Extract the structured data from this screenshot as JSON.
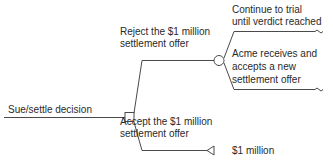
{
  "diagram": {
    "type": "decision-tree",
    "root": {
      "label": "Sue/settle decision",
      "node_type": "decision"
    },
    "branches": {
      "reject": {
        "label_line1": "Reject the $1 million",
        "label_line2": "settlement offer",
        "node_type": "chance",
        "outcomes": {
          "trial": {
            "label_line1": "Continue to trial",
            "label_line2": "until verdict reached",
            "terminal": "continues"
          },
          "new_offer": {
            "label_line1": "Acme receives and",
            "label_line2": "accepts a new",
            "label_line3": "settlement offer",
            "terminal": "continues"
          }
        }
      },
      "accept": {
        "label_line1": "Accept the $1 million",
        "label_line2": "settlement offer",
        "node_type": "end",
        "payoff": "$1 million"
      }
    },
    "colors": {
      "line": "#4a4a4a",
      "text": "#2a2a2a",
      "background": "#ffffff"
    }
  }
}
